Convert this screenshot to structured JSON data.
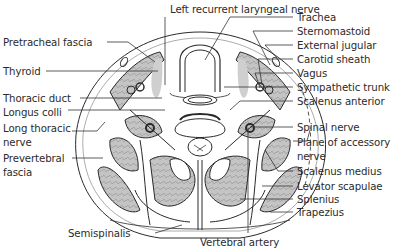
{
  "figure": {
    "colors": {
      "line": "#2a2a2a",
      "muscle_fill": "#bdbdbd",
      "fascia_fill": "#d9d9d9",
      "background": "#ffffff"
    }
  },
  "labels": {
    "top": [
      {
        "id": "left-recurrent-laryngeal-nerve",
        "text": "Left recurrent laryngeal nerve"
      }
    ],
    "left": [
      {
        "id": "pretracheal-fascia",
        "text": "Pretracheal fascia"
      },
      {
        "id": "thyroid",
        "text": "Thyroid"
      },
      {
        "id": "thoracic-duct",
        "text": "Thoracic duct"
      },
      {
        "id": "longus-colli",
        "text": "Longus colli"
      },
      {
        "id": "long-thoracic-nerve-1",
        "text": "Long thoracic"
      },
      {
        "id": "long-thoracic-nerve-2",
        "text": "nerve"
      },
      {
        "id": "prevertebral-fascia-1",
        "text": "Prevertebral"
      },
      {
        "id": "prevertebral-fascia-2",
        "text": "fascia"
      }
    ],
    "right": [
      {
        "id": "trachea",
        "text": "Trachea"
      },
      {
        "id": "sternomastoid",
        "text": "Sternomastoid"
      },
      {
        "id": "external-jugular",
        "text": "External jugular"
      },
      {
        "id": "carotid-sheath",
        "text": "Carotid sheath"
      },
      {
        "id": "vagus",
        "text": "Vagus"
      },
      {
        "id": "sympathetic-trunk",
        "text": "Sympathetic trunk"
      },
      {
        "id": "scalenus-anterior",
        "text": "Scalenus anterior"
      },
      {
        "id": "spinal-nerve",
        "text": "Spinal nerve"
      },
      {
        "id": "plane-of-accessory-nerve-1",
        "text": "Plane of accessory"
      },
      {
        "id": "plane-of-accessory-nerve-2",
        "text": "nerve"
      },
      {
        "id": "scalenus-medius",
        "text": "Scalenus medius"
      },
      {
        "id": "levator-scapulae",
        "text": "Levator scapulae"
      },
      {
        "id": "splenius",
        "text": "Splenius"
      },
      {
        "id": "trapezius",
        "text": "Trapezius"
      }
    ],
    "bottom": [
      {
        "id": "semispinalis",
        "text": "Semispinalis"
      },
      {
        "id": "vertebral-artery",
        "text": "Vertebral artery"
      }
    ]
  }
}
